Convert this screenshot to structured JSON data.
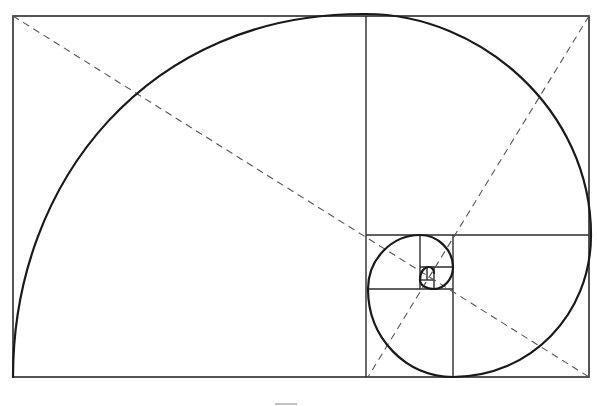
{
  "figure": {
    "type": "golden-spiral-diagram",
    "colors": {
      "line": "#2b2b2b",
      "spiral": "#1a1a1a",
      "dashed": "#555555",
      "background": "#ffffff"
    },
    "outer_rect": {
      "x": 13,
      "y": 16,
      "w": 576,
      "h": 361
    },
    "division_lines": [
      {
        "x1": 366,
        "y1": 16,
        "x2": 366,
        "y2": 377
      },
      {
        "x1": 366,
        "y1": 235,
        "x2": 589,
        "y2": 235
      },
      {
        "x1": 453,
        "y1": 235,
        "x2": 453,
        "y2": 377
      },
      {
        "x1": 368,
        "y1": 289,
        "x2": 453,
        "y2": 289
      },
      {
        "x1": 420,
        "y1": 235,
        "x2": 420,
        "y2": 289
      },
      {
        "x1": 420,
        "y1": 267,
        "x2": 453,
        "y2": 267
      },
      {
        "x1": 434,
        "y1": 267,
        "x2": 434,
        "y2": 289
      },
      {
        "x1": 420,
        "y1": 280,
        "x2": 434,
        "y2": 280
      },
      {
        "x1": 427,
        "y1": 267,
        "x2": 427,
        "y2": 280
      }
    ],
    "diagonals": [
      {
        "x1": 13,
        "y1": 16,
        "x2": 589,
        "y2": 377
      },
      {
        "x1": 589,
        "y1": 16,
        "x2": 368,
        "y2": 377
      }
    ],
    "spiral_path": "M 13 377 C 13 180, 150 12, 366 14 C 480 14, 591 110, 591 235 C 591 315, 530 377, 453 377 C 406 377, 368 338, 368 289 C 368 259, 392 235, 420 235 C 438 235, 453 250, 453 267 C 453 279, 444 289, 434 289 C 426 289, 420 285, 420 280 C 420 272, 424 267, 429 267 C 432 267, 434 270, 434 273",
    "caption": {
      "visible": "cropped",
      "text": ""
    }
  }
}
